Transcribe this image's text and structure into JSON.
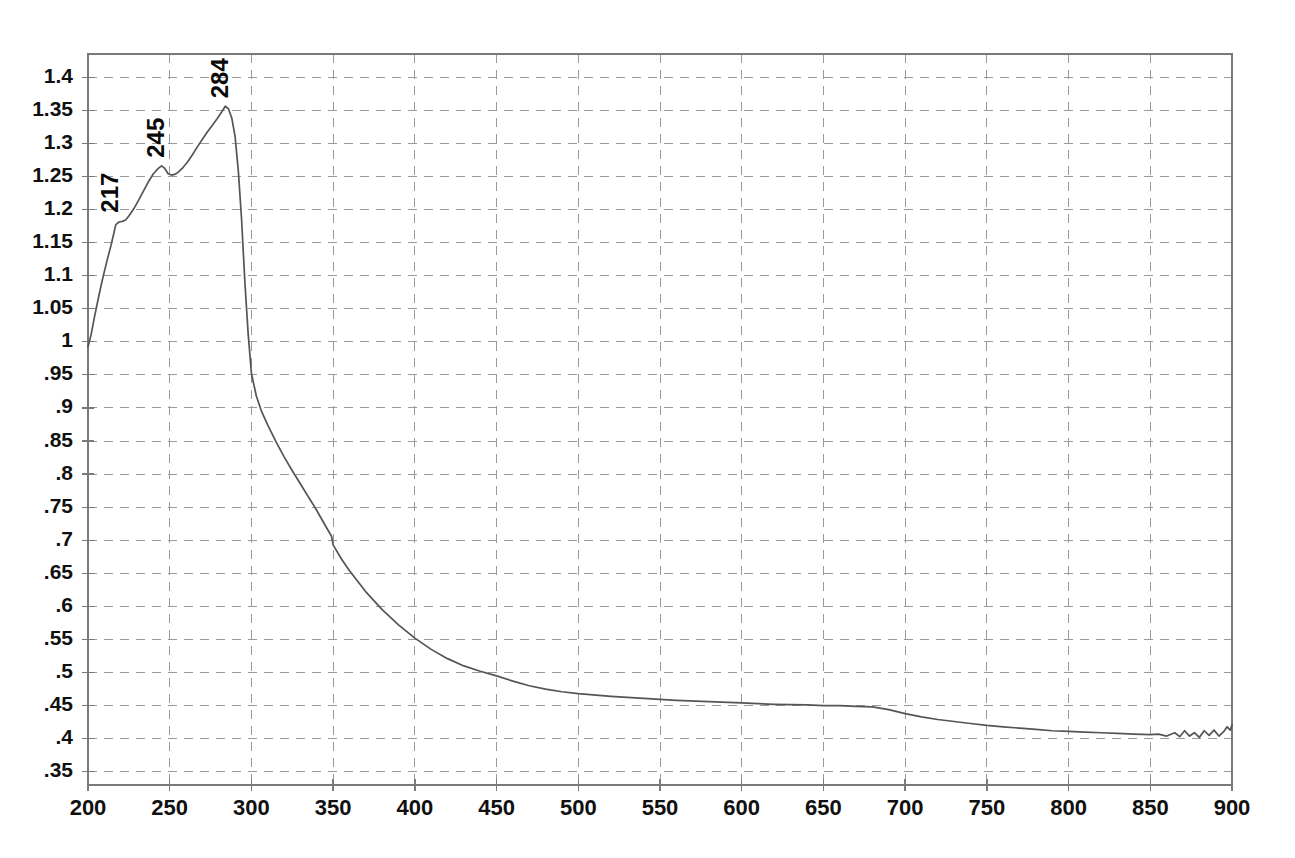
{
  "chart_data": {
    "type": "line",
    "title": "",
    "subtitle": "",
    "xlabel": "",
    "ylabel": "",
    "xlim": [
      200,
      900
    ],
    "ylim": [
      0.33,
      1.435
    ],
    "grid": true,
    "legend": null,
    "legend_position": "none",
    "line_color": "#555555",
    "grid_color": "#9a9a9a",
    "frame_color": "#7a7a7a",
    "text_color": "#101010",
    "background_color": "#ffffff",
    "x_ticks": [
      200,
      250,
      300,
      350,
      400,
      450,
      500,
      550,
      600,
      650,
      700,
      750,
      800,
      850,
      900
    ],
    "x_tick_labels": [
      "200",
      "250",
      "300",
      "350",
      "400",
      "450",
      "500",
      "550",
      "600",
      "650",
      "700",
      "750",
      "800",
      "850",
      "900"
    ],
    "y_ticks": [
      0.35,
      0.4,
      0.45,
      0.5,
      0.55,
      0.6,
      0.65,
      0.7,
      0.75,
      0.8,
      0.85,
      0.9,
      0.95,
      1.0,
      1.05,
      1.1,
      1.15,
      1.2,
      1.25,
      1.3,
      1.35,
      1.4
    ],
    "y_tick_labels": [
      ".35",
      ".4",
      ".45",
      ".5",
      ".55",
      ".6",
      ".65",
      ".7",
      ".75",
      ".8",
      ".85",
      ".9",
      ".95",
      "1",
      "1.05",
      "1.1",
      "1.15",
      "1.2",
      "1.25",
      "1.3",
      "1.35",
      "1.4"
    ],
    "annotations": [
      {
        "label": "217",
        "x": 217,
        "y": 1.183,
        "rotation": -90
      },
      {
        "label": "245",
        "x": 245,
        "y": 1.266,
        "rotation": -90
      },
      {
        "label": "284",
        "x": 284,
        "y": 1.356,
        "rotation": -90
      }
    ],
    "series": [
      {
        "name": "absorbance",
        "x": [
          200,
          202,
          204,
          206,
          208,
          210,
          212,
          214,
          216,
          217,
          219,
          221,
          223,
          225,
          228,
          231,
          234,
          237,
          240,
          243,
          245,
          247,
          249,
          251,
          253,
          255,
          258,
          261,
          264,
          267,
          270,
          273,
          276,
          279,
          282,
          284,
          286,
          288,
          290,
          292,
          294,
          296,
          298,
          300,
          303,
          306,
          310,
          315,
          320,
          325,
          330,
          335,
          340,
          345,
          349,
          350,
          355,
          360,
          370,
          380,
          390,
          400,
          410,
          420,
          430,
          440,
          450,
          460,
          470,
          480,
          490,
          500,
          520,
          540,
          560,
          580,
          600,
          620,
          640,
          650,
          660,
          670,
          680,
          690,
          700,
          710,
          720,
          730,
          740,
          750,
          760,
          770,
          780,
          790,
          800,
          810,
          820,
          830,
          840,
          850,
          855,
          860,
          865,
          868,
          871,
          874,
          877,
          880,
          883,
          886,
          889,
          892,
          895,
          897,
          899,
          900
        ],
        "y": [
          0.992,
          1.012,
          1.038,
          1.062,
          1.085,
          1.106,
          1.126,
          1.145,
          1.166,
          1.177,
          1.181,
          1.182,
          1.184,
          1.19,
          1.201,
          1.214,
          1.228,
          1.242,
          1.254,
          1.262,
          1.266,
          1.262,
          1.254,
          1.252,
          1.253,
          1.256,
          1.263,
          1.272,
          1.283,
          1.295,
          1.306,
          1.317,
          1.327,
          1.337,
          1.348,
          1.356,
          1.352,
          1.338,
          1.31,
          1.258,
          1.184,
          1.09,
          1.012,
          0.952,
          0.918,
          0.896,
          0.874,
          0.849,
          0.826,
          0.805,
          0.785,
          0.765,
          0.745,
          0.723,
          0.706,
          0.693,
          0.672,
          0.654,
          0.622,
          0.595,
          0.572,
          0.552,
          0.535,
          0.521,
          0.51,
          0.502,
          0.495,
          0.487,
          0.48,
          0.475,
          0.471,
          0.468,
          0.464,
          0.461,
          0.458,
          0.456,
          0.454,
          0.452,
          0.451,
          0.45,
          0.45,
          0.449,
          0.448,
          0.444,
          0.438,
          0.433,
          0.429,
          0.426,
          0.423,
          0.42,
          0.418,
          0.416,
          0.414,
          0.412,
          0.411,
          0.41,
          0.409,
          0.408,
          0.407,
          0.406,
          0.407,
          0.404,
          0.409,
          0.403,
          0.412,
          0.404,
          0.409,
          0.402,
          0.412,
          0.405,
          0.413,
          0.404,
          0.411,
          0.418,
          0.413,
          0.421
        ]
      }
    ],
    "discontinuity": {
      "x": 350,
      "y_before": 0.706,
      "y_after": 0.693,
      "note": "detector changeover step at 350 nm"
    }
  }
}
